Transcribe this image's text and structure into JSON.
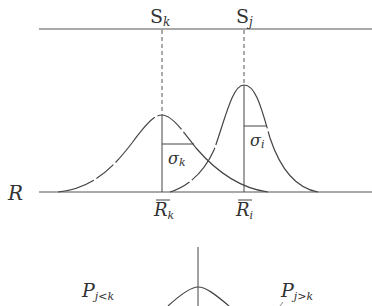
{
  "diagram": {
    "top_axis": {
      "labels": [
        {
          "main": "S",
          "sub": "k"
        },
        {
          "main": "S",
          "sub": "j"
        }
      ]
    },
    "baseline": {
      "axis_label": "R",
      "labels": [
        {
          "main": "R",
          "sub": "k",
          "overbar": true
        },
        {
          "main": "R",
          "sub": "i",
          "overbar": true
        }
      ]
    },
    "curves": [
      {
        "name": "distribution-k",
        "sigma_label": {
          "main": "σ",
          "sub": "k"
        }
      },
      {
        "name": "distribution-j",
        "sigma_label": {
          "main": "σ",
          "sub": "i"
        }
      }
    ],
    "bottom": {
      "left_label": {
        "main": "P",
        "sub": "j<k"
      },
      "right_label": {
        "main": "P",
        "sub": "j>k"
      }
    },
    "colors": {
      "stroke": "#444444",
      "text": "#333333"
    }
  }
}
